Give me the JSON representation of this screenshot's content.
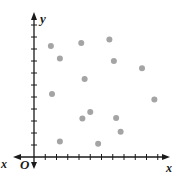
{
  "chart_data": {
    "type": "scatter",
    "title": "",
    "xlabel": "x",
    "ylabel": "y",
    "origin_label": "O",
    "x_ticks": [
      1,
      2,
      3,
      4,
      5,
      6,
      7,
      8,
      9,
      10,
      11
    ],
    "y_ticks": [
      1,
      2,
      3,
      4,
      5,
      6,
      7,
      8,
      9,
      10,
      11
    ],
    "tick_labels_shown": false,
    "xlim": [
      0,
      12
    ],
    "ylim": [
      0,
      12
    ],
    "grid": false,
    "legend": null,
    "point_color": "#a4a4a4",
    "series": [
      {
        "name": "points",
        "x": [
          1.5,
          2.3,
          4.2,
          6.7,
          7.1,
          9.6,
          4.5,
          1.6,
          10.7,
          5.0,
          4.3,
          7.3,
          7.7,
          2.3,
          5.7
        ],
        "y": [
          9.25,
          8.2,
          9.5,
          9.8,
          8.0,
          7.4,
          6.5,
          5.25,
          4.8,
          3.75,
          3.2,
          3.25,
          2.1,
          1.3,
          1.1
        ]
      }
    ]
  },
  "labels": {
    "x_axis": "x",
    "x_axis_negative": "x",
    "y_axis": "y",
    "origin": "O"
  }
}
